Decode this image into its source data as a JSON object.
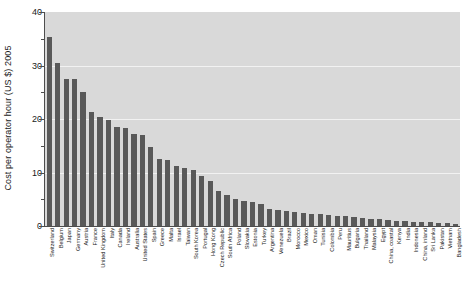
{
  "chart_data": {
    "type": "bar",
    "title": "",
    "xlabel": "",
    "ylabel": "Cost per operator hour (US $) 2005",
    "ylim": [
      0,
      40
    ],
    "yticks": [
      0,
      10,
      20,
      30,
      40
    ],
    "ytick_labels": [
      "0",
      "10",
      "20",
      "30",
      "40"
    ],
    "yminor_ticks": [
      5,
      15,
      25,
      35
    ],
    "grid": "horizontal-major-white",
    "legend": "none",
    "bar_color": "#595959",
    "plot_background": "#d9d9d9",
    "figure_background": "#ffffff",
    "categories": [
      "Switzerland",
      "Belgium",
      "Japan",
      "Germany",
      "Austria",
      "France",
      "United Kingdom",
      "Italy",
      "Canada",
      "Ireland",
      "Australia",
      "United States",
      "Spain",
      "Greece",
      "Malta",
      "Israel",
      "Taiwan",
      "South Korea",
      "Portugal",
      "Hong Kong",
      "Czech Republic",
      "South Africa",
      "Poland",
      "Slovakia",
      "Estonia",
      "Turkey",
      "Argentina",
      "Venezuela",
      "Brazil",
      "Morocco",
      "Mexico",
      "Oman",
      "Tunisia",
      "Colombia",
      "Peru",
      "Mauritius",
      "Bulgaria",
      "Thailand",
      "Malaysia",
      "Egypt",
      "China, coastal",
      "Kenya",
      "India",
      "Indonesia",
      "China, inland",
      "Sri Lanka",
      "Pakistan",
      "Vietnam",
      "Bangladesh"
    ],
    "values": [
      35.4,
      30.5,
      27.5,
      27.4,
      25.0,
      21.3,
      20.3,
      19.9,
      18.5,
      18.3,
      17.2,
      17.1,
      14.8,
      12.5,
      12.3,
      11.2,
      10.9,
      10.5,
      9.4,
      8.4,
      6.5,
      5.8,
      5.1,
      4.7,
      4.4,
      4.1,
      3.1,
      3.0,
      2.9,
      2.6,
      2.5,
      2.3,
      2.2,
      2.1,
      1.9,
      1.8,
      1.6,
      1.5,
      1.4,
      1.3,
      1.1,
      1.0,
      0.9,
      0.8,
      0.8,
      0.7,
      0.6,
      0.5,
      0.3
    ]
  }
}
